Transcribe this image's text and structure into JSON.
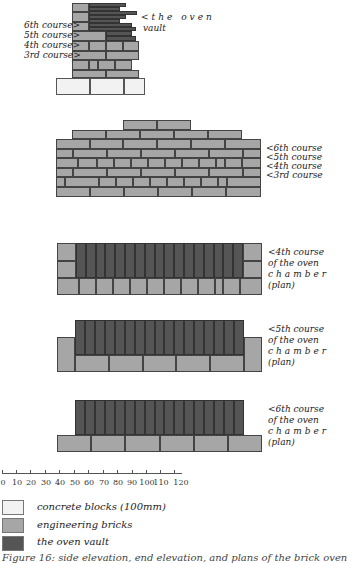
{
  "figure": {
    "colors": {
      "concrete_blocks": "#f2f2f2",
      "engineering_bricks": "#a6a6a6",
      "oven_vault": "#555555",
      "mortar_line": "#444444"
    },
    "side_elevation": {
      "labels": {
        "vault": "<the oven",
        "vault_line2": "vault",
        "c6": "6th course>",
        "c5": "5th course>",
        "c4": "4th course>",
        "c3": "3rd course>"
      }
    },
    "end_elevation": {
      "labels": {
        "c6": "<6th course",
        "c5": "<5th course",
        "c4": "<4th course",
        "c3": "<3rd course"
      }
    },
    "plans": [
      {
        "line1": "<4th course",
        "line2": "of the oven",
        "line3": "chamber",
        "line4": "(plan)"
      },
      {
        "line1": "<5th course",
        "line2": "of the oven",
        "line3": "chamber",
        "line4": "(plan)"
      },
      {
        "line1": "<6th course",
        "line2": "of the oven",
        "line3": "chamber",
        "line4": "(plan)"
      }
    ],
    "scale": {
      "ticks": [
        "0",
        "10",
        "20",
        "30",
        "40",
        "50",
        "60",
        "70",
        "80",
        "90",
        "100",
        "110",
        "120",
        "130cm"
      ]
    },
    "legend": [
      {
        "label": "concrete blocks (100mm)",
        "swatch": "concrete_blocks"
      },
      {
        "label": "engineering bricks",
        "swatch": "engineering_bricks"
      },
      {
        "label": "the oven vault",
        "swatch": "oven_vault"
      }
    ],
    "caption": "Figure 16: side elevation, end elevation, and plans of the brick oven"
  }
}
